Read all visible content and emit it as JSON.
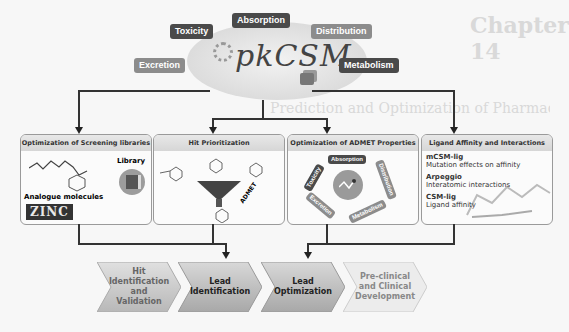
{
  "background": {
    "faded_text": [
      "Chapter 14",
      "Prediction and Optimization of Pharmacokinetic and Toxicity Properties"
    ]
  },
  "hub": {
    "logo": "pkCSM",
    "properties": [
      {
        "label": "Toxicity",
        "style": "dark"
      },
      {
        "label": "Absorption",
        "style": "dark"
      },
      {
        "label": "Distribution",
        "style": "mid"
      },
      {
        "label": "Excretion",
        "style": "mid"
      },
      {
        "label": "Metabolism",
        "style": "dark"
      }
    ]
  },
  "panels": [
    {
      "title": "Optimization of Screening libraries",
      "library_label": "Library",
      "analogue_label": "Analogue molecules",
      "zinc_label": "ZINC"
    },
    {
      "title": "Hit Prioritization",
      "funnel_label": "ADMET"
    },
    {
      "title": "Optimization of ADMET Properties",
      "ring_labels": [
        "Absorption",
        "Distribution",
        "Metabolism",
        "Excretion",
        "Toxicity"
      ]
    },
    {
      "title": "Ligand Affinity and Interactions",
      "tools": [
        {
          "name": "mCSM-lig",
          "desc": "Mutation effects on affinity"
        },
        {
          "name": "Arpeggio",
          "desc": "Interatomic interactions"
        },
        {
          "name": "CSM-lig",
          "desc": "Ligand affinity"
        }
      ]
    }
  ],
  "pipeline": [
    {
      "label": "Hit\nIdentification\nand Validation",
      "fill": "#c4c4c4",
      "text": "#666666"
    },
    {
      "label": "Lead\nIdentification",
      "fill": "#b0b0b0",
      "text": "#222222"
    },
    {
      "label": "Lead\nOptimization",
      "fill": "#b0b0b0",
      "text": "#222222"
    },
    {
      "label": "Pre-clinical\nand Clinical\nDevelopment",
      "fill": "#e6e6e6",
      "text": "#888888"
    }
  ]
}
